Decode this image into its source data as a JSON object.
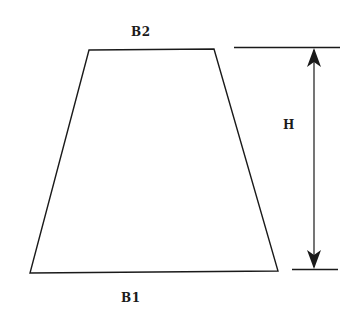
{
  "diagram": {
    "type": "trapezoid-dimension-drawing",
    "labels": {
      "top_base": "B2",
      "bottom_base": "B1",
      "height": "H"
    },
    "colors": {
      "line": "#1a1a1a",
      "background": "#ffffff"
    }
  }
}
